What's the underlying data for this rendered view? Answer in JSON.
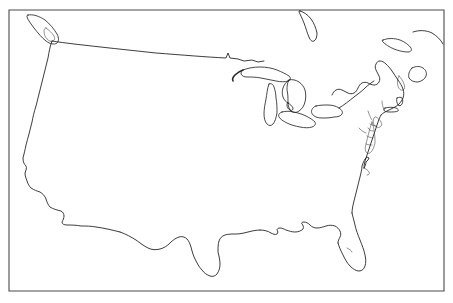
{
  "figure": {
    "width": 453,
    "height": 303,
    "background_color": "#ffffff",
    "line_color": "#1a1a1a",
    "frame_color": "#4a4a4a"
  },
  "frame": {
    "name": "map-border-frame",
    "x": 9,
    "y": 10,
    "width": 435,
    "height": 281
  },
  "features": [
    {
      "id": "mainland",
      "label": "United States mainland outline"
    },
    {
      "id": "northern-border",
      "label": "United States-Canada border (49th parallel)"
    },
    {
      "id": "pacific-coast",
      "label": "Pacific coastline"
    },
    {
      "id": "gulf-coast",
      "label": "Gulf of Mexico coastline"
    },
    {
      "id": "atlantic-coast",
      "label": "Atlantic coastline"
    },
    {
      "id": "florida-peninsula",
      "label": "Florida peninsula"
    },
    {
      "id": "texas-rio-grande",
      "label": "Rio Grande / Texas southern border"
    },
    {
      "id": "baja-vancouver",
      "label": "Vancouver Island and Puget Sound"
    },
    {
      "id": "lake-superior",
      "label": "Lake Superior"
    },
    {
      "id": "lake-michigan",
      "label": "Lake Michigan"
    },
    {
      "id": "lake-huron",
      "label": "Lake Huron"
    },
    {
      "id": "lake-erie",
      "label": "Lake Erie"
    },
    {
      "id": "lake-ontario",
      "label": "Lake Ontario"
    },
    {
      "id": "chesapeake-bay",
      "label": "Chesapeake Bay and Delaware Bay"
    },
    {
      "id": "long-island",
      "label": "Long Island"
    },
    {
      "id": "cape-cod",
      "label": "Cape Cod"
    },
    {
      "id": "maine-maritimes",
      "label": "Maine and Canadian Maritimes"
    },
    {
      "id": "nova-scotia",
      "label": "Nova Scotia"
    },
    {
      "id": "gaspe-stlawrence",
      "label": "Gulf of St. Lawrence"
    },
    {
      "id": "hudson-bay-lobe",
      "label": "Southern James Bay inlet"
    }
  ],
  "paths": {
    "frame_rect": "M9,10 L444,10 L444,291 L9,291 Z",
    "northern_border": "M52,41 C58,42 66,43 74,44 C100,47 128,50 156,53 C182,55 206,57 226,58 L228,53 L230,58 L238,59 L244,61 L252,60 L258,62 L264,61",
    "pacific_coast": "M52,41 C50,46 49,52 48,58 C46,66 44,74 42,82 C40,90 38,98 36,106 C34,112 33,117 32,122 C31,126 30,130 29,134 C28,138 27,141 26,145 C25,150 24,154 23,158 C23,162 24,164 26,166 C27,168 26,170 25,173 C25,176 26,178 27,181 C28,184 29,186 31,188 C34,190 37,191 40,192 C43,194 45,196 46,199 C47,202 48,205 50,207 C53,209 57,210 61,211 C63,212 64,214 64,216 C64,218 63,220 62,222 C62,224 64,225 67,225 C71,225 76,225 81,226 C86,226 91,226 96,227 C104,228 112,230 120,232",
    "mexico_border": "M120,232 C126,234 131,237 136,240 C140,243 144,246 148,248 C152,250 156,250 160,249 C164,248 167,246 170,243 C173,240 176,238 179,237 C182,236 185,237 187,239 C189,241 190,244 191,247 C192,251 193,255 195,259 C197,263 199,267 202,270 C204,273 207,275 210,276 C213,277 215,276 217,274 C219,271 220,268 220,264 C220,260 219,256 218,252 C218,248 218,244 219,241 C220,238 222,236 225,235 C228,234 232,234 236,234 C240,234 244,233 248,232 C252,231 256,230 260,230",
    "gulf_coast": "M260,230 C264,230 268,231 271,233 C273,234 275,235 277,234 C278,233 278,231 277,230 C277,229 278,228 280,228 C282,228 284,229 286,230 C289,231 292,232 295,232 C298,232 301,231 303,229 C304,227 303,225 302,224 C301,223 302,222 304,222 C306,222 308,223 310,225 C312,227 314,228 317,228 C320,228 323,227 326,226 C329,225 332,225 335,226 C337,227 339,229 340,231 C341,233 341,235 340,237 C339,239 338,241 338,243",
    "florida_peninsula": "M338,243 C339,247 341,251 343,255 C345,259 347,263 350,266 C353,269 356,271 359,271 C362,271 364,269 365,266 C366,263 366,259 365,255 C364,250 362,245 360,240 C358,235 356,230 355,225 C354,221 353,217 352,213",
    "atlantic_coast_south": "M352,213 C352,209 353,205 354,201 C355,197 356,193 357,189 C358,185 359,181 360,177 C361,173 362,169 362,166 C363,163 364,161 365,159 L367,157 L369,158 L368,160 L366,162 C366,164 365,166 364,168",
    "chesapeake_coast": "M364,168 C364,164 365,161 366,158 C367,155 368,152 369,149 C370,146 371,143 372,140 C373,137 374,134 375,131 C376,128 377,125 378,122 C379,119 380,117 381,115",
    "northeast_coast": "M381,115 C383,113 385,112 387,111 C389,110 391,109 393,108 C395,107 397,106 399,104 C401,102 402,100 403,98 C404,95 404,92 403,89 C402,86 400,83 398,80 C396,77 394,74 392,71 C390,68 388,66 386,64 C384,62 382,61 380,61 C378,61 377,62 376,64 C375,66 375,68 376,70 C377,72 378,74 379,76 C380,78 380,80 379,82 C378,84 376,85 374,85 C372,85 370,84 368,83 C366,82 364,82 362,83 C360,84 359,86 358,88 C357,90 356,92 354,93 C352,94 350,94 348,93 C346,92 344,91 342,90 C340,89 338,89 336,90 C334,91 333,93 332,95",
    "lake_ontario": "M316,106 C320,105 324,105 328,105 C332,105 336,106 339,108 C342,110 343,112 342,114 C341,116 338,117 334,117 C330,118 326,118 322,118 C318,118 315,117 313,115 C311,113 311,110 313,108 C314,107 315,106 316,106 Z",
    "lake_erie": "M282,112 C286,111 290,111 294,112 C298,113 302,114 306,116 C310,118 313,120 315,122 C316,124 315,126 312,127 C309,128 305,128 300,127 C295,126 291,125 287,123 C283,121 280,119 279,117 C278,115 279,113 282,112 Z",
    "lake_huron": "M289,80 C292,79 296,80 299,82 C302,84 304,87 305,90 C306,94 306,98 305,102 C304,106 302,109 299,111 C296,113 293,113 291,111 C289,109 288,106 288,102 C288,98 288,94 287,90 C287,87 287,83 289,80 Z",
    "lake_huron_bay": "M289,80 C286,82 284,85 283,88 C282,91 282,94 283,97 C284,100 286,102 288,103",
    "lake_michigan": "M269,84 C271,83 273,84 274,87 C275,90 276,94 276,98 C277,103 277,108 277,113 C276,118 275,122 273,124 C271,126 269,126 267,124 C265,122 264,118 264,114 C264,109 265,104 266,99 C267,94 267,89 269,84 Z",
    "lake_superior": "M243,70 C248,68 254,67 260,67 C266,67 272,68 277,70 C282,72 286,74 289,76 C291,78 291,80 288,81 C285,82 281,82 276,81 C271,80 266,79 261,78 C256,77 251,77 247,77 C244,77 242,76 241,74 C241,72 242,71 243,70 Z",
    "lake_superior_shore": "M243,70 C240,71 237,73 235,75 C233,77 232,79 233,81",
    "chesapeake_bay": "M372,122 C373,125 374,128 374,131 C375,135 375,139 375,143 C374,147 373,150 371,152 C369,154 367,154 366,152 C365,150 365,147 366,144 C367,140 368,136 369,132 C370,128 371,125 372,122 Z",
    "delaware_bay": "M376,117 C378,118 380,120 381,122 C382,124 382,126 380,127 C378,128 376,127 374,125 C373,123 373,120 374,118 Z",
    "long_island": "M385,108 C389,107 393,107 396,108 C398,109 399,110 398,111 C396,112 393,112 389,112 C386,112 384,111 384,110 C384,109 384,108 385,108 Z",
    "cape_cod": "M397,98 C399,97 401,97 402,98 C403,100 403,102 402,104 C401,106 399,106 398,105 C397,103 396,100 397,98 Z",
    "vancouver_island": "M28,15 C33,14 39,16 45,20 C50,24 54,29 57,34 C59,38 59,41 57,43 C54,45 50,44 46,41 C42,38 38,33 34,28 C31,24 28,20 27,17 C27,16 27,15 28,15 Z",
    "puget_sound": "M46,28 C49,30 52,33 54,36 C55,38 55,40 53,41 C51,42 49,41 47,39 C45,37 44,34 44,31 C44,29 45,28 46,28 Z",
    "gaspe_peninsula": "M383,40 C388,38 394,38 400,40 C405,42 409,45 411,48 C412,50 411,52 408,52 C404,52 399,51 394,49 C389,47 385,44 383,42 C382,41 382,40 383,40 Z",
    "nova_scotia": "M412,68 C416,66 420,66 423,68 C426,70 427,73 426,76 C425,79 422,81 418,82 C414,82 411,81 409,78 C408,75 409,71 412,68 Z",
    "newfoundland_edge": "M413,32 C419,30 426,30 432,33 C437,36 441,40 443,44",
    "james_bay": "M300,11 C304,12 308,15 311,19 C314,23 316,28 317,33 C317,37 316,40 314,41 C312,42 310,40 309,37 C307,33 306,28 304,23 C302,18 300,14 299,12 C299,11 299,11 300,11 Z",
    "st_lawrence_river": "M339,108 C344,105 349,101 354,97 C358,94 362,91 365,88 C368,85 371,83 374,81",
    "bay_of_fundy": "M399,76 C401,78 403,81 404,84 C405,87 405,89 403,90 C401,91 399,89 398,86 C397,83 397,79 399,76 Z",
    "lake_stclair": "M288,103 C290,104 292,106 293,108 C293,110 292,111 290,110 C288,109 287,107 287,105 C287,104 287,103 288,103 Z",
    "chesapeake_tributary_1": "M368,128 C369,130 371,131 373,131",
    "chesapeake_tributary_2": "M367,136 C369,137 371,138 373,138",
    "chesapeake_tributary_3": "M366,144 C368,145 370,145 372,145",
    "chesapeake_tributary_4": "M370,124 C372,125 374,126 376,126",
    "florida_inlet": "M347,248 C349,249 351,250 352,252",
    "potomac": "M366,133 C363,132 361,130 359,128",
    "susquehanna": "M372,120 C370,117 369,114 368,111",
    "hatteras_hook": "M364,168 C366,169 368,170 369,172 C370,174 369,175 367,175",
    "hudson_river": "M384,110 C383,107 382,104 382,101"
  }
}
